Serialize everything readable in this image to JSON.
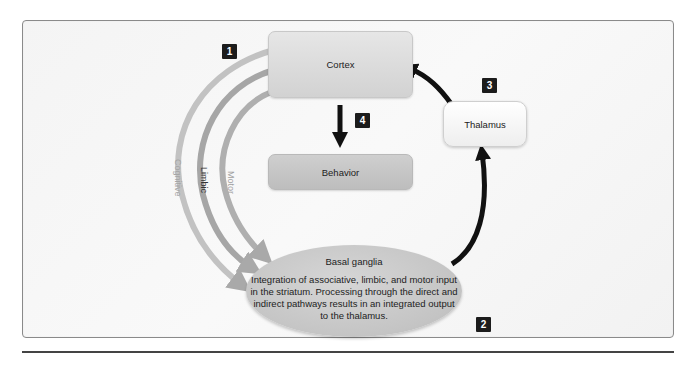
{
  "diagram": {
    "nodes": {
      "cortex": "Cortex",
      "behavior": "Behavior",
      "thalamus": "Thalamus",
      "basal_ganglia": {
        "title": "Basal ganglia",
        "description": "Integration of associative, limbic, and motor input in the striatum. Processing through the direct and indirect pathways results in an integrated output to the thalamus."
      }
    },
    "loops": [
      {
        "label": "Cognitive",
        "color": "#c0c0c0"
      },
      {
        "label": "Limbic",
        "color": "#a8a8a8"
      },
      {
        "label": "Motor",
        "color": "#b0b0b0"
      }
    ],
    "steps": [
      "1",
      "2",
      "3",
      "4"
    ],
    "edges": [
      {
        "from": "Cortex",
        "to": "Basal ganglia",
        "step": "1",
        "via": [
          "Cognitive",
          "Limbic",
          "Motor"
        ]
      },
      {
        "from": "Basal ganglia",
        "to": "Thalamus",
        "step": "2"
      },
      {
        "from": "Thalamus",
        "to": "Cortex",
        "step": "3"
      },
      {
        "from": "Cortex",
        "to": "Behavior",
        "step": "4"
      }
    ],
    "colors": {
      "arrow_dark": "#111111",
      "arc_gray": "#b5b5b5",
      "badge_bg": "#1c1c1c",
      "panel_border": "#8a8a8a"
    }
  }
}
